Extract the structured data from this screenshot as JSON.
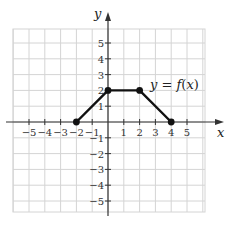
{
  "chart_data": {
    "type": "line",
    "title": "",
    "xlabel": "x",
    "ylabel": "y",
    "xlim": [
      -6,
      6
    ],
    "ylim": [
      -6,
      6
    ],
    "grid": true,
    "x_ticks": [
      -5,
      -4,
      -3,
      -2,
      -1,
      1,
      2,
      3,
      4,
      5
    ],
    "y_ticks": [
      5,
      4,
      3,
      2,
      1,
      -1,
      -2,
      -3,
      -4,
      -5
    ],
    "x_tick_labels": [
      "−5",
      "−4",
      "−3",
      "−2",
      "−1",
      "1",
      "2",
      "3",
      "4",
      "5"
    ],
    "y_tick_labels": [
      "5",
      "4",
      "3",
      "2",
      "1",
      "−1",
      "−2",
      "−3",
      "−4",
      "−5"
    ],
    "series": [
      {
        "name": "y = f(x)",
        "points": [
          [
            -2,
            0
          ],
          [
            0,
            2
          ],
          [
            2,
            2
          ],
          [
            4,
            0
          ]
        ],
        "markers": [
          [
            -2,
            0
          ],
          [
            0,
            2
          ],
          [
            2,
            2
          ],
          [
            4,
            0
          ]
        ],
        "color": "#111111"
      }
    ],
    "annotations": [
      {
        "text": "y = f(x)",
        "x": 2.3,
        "y": 2.4
      }
    ]
  },
  "labels": {
    "x_axis": "x",
    "y_axis": "y",
    "function": "y = f(x)"
  },
  "colors": {
    "grid": "#d4d4d4",
    "axis": "#333333",
    "curve": "#111111"
  }
}
